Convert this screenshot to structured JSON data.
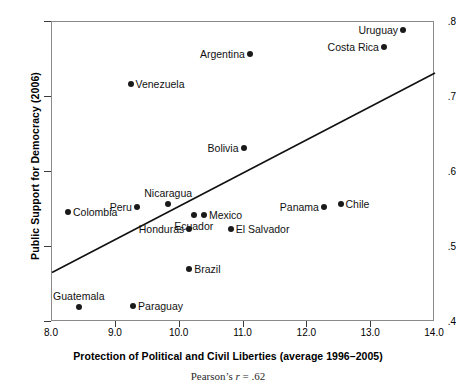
{
  "chart_data": {
    "type": "scatter",
    "title": "",
    "xlabel": "Protection of Political and Civil Liberties (average 1996–2005)",
    "ylabel": "Public Support for Democracy (2006)",
    "caption_prefix": "Pearson’s ",
    "caption_stat": "r",
    "caption_value": " = .62",
    "xlim": [
      8.0,
      14.0
    ],
    "ylim": [
      0.4,
      0.8
    ],
    "grid": false,
    "legend": "none",
    "xticks": [
      "8.0",
      "9.0",
      "10.0",
      "11.0",
      "12.0",
      "13.0",
      "14.0"
    ],
    "xtick_values": [
      8.0,
      9.0,
      10.0,
      11.0,
      12.0,
      13.0,
      14.0
    ],
    "yticks": [
      ".4",
      ".5",
      ".6",
      ".7",
      ".8"
    ],
    "ytick_values": [
      0.4,
      0.5,
      0.6,
      0.7,
      0.8
    ],
    "points": [
      {
        "label": "Uruguay",
        "x": 13.5,
        "y": 0.789,
        "pos": "left"
      },
      {
        "label": "Costa Rica",
        "x": 13.2,
        "y": 0.767,
        "pos": "left"
      },
      {
        "label": "Argentina",
        "x": 11.1,
        "y": 0.757,
        "pos": "left"
      },
      {
        "label": "Venezuela",
        "x": 9.23,
        "y": 0.717,
        "pos": "right"
      },
      {
        "label": "Bolivia",
        "x": 11.0,
        "y": 0.632,
        "pos": "left"
      },
      {
        "label": "Nicaragua",
        "x": 9.82,
        "y": 0.557,
        "pos": "above"
      },
      {
        "label": "Chile",
        "x": 12.52,
        "y": 0.557,
        "pos": "right"
      },
      {
        "label": "Peru",
        "x": 9.33,
        "y": 0.553,
        "pos": "left"
      },
      {
        "label": "Panama",
        "x": 12.26,
        "y": 0.553,
        "pos": "left"
      },
      {
        "label": "Colombia",
        "x": 8.25,
        "y": 0.547,
        "pos": "right"
      },
      {
        "label": "Mexico",
        "x": 10.38,
        "y": 0.543,
        "pos": "right"
      },
      {
        "label": "Ecuador",
        "x": 10.22,
        "y": 0.543,
        "pos": "below"
      },
      {
        "label": "Honduras",
        "x": 10.15,
        "y": 0.524,
        "pos": "left"
      },
      {
        "label": "El Salvador",
        "x": 10.8,
        "y": 0.524,
        "pos": "right"
      },
      {
        "label": "Brazil",
        "x": 10.15,
        "y": 0.471,
        "pos": "right"
      },
      {
        "label": "Paraguay",
        "x": 9.27,
        "y": 0.421,
        "pos": "right"
      },
      {
        "label": "Guatemala",
        "x": 8.42,
        "y": 0.42,
        "pos": "above"
      }
    ],
    "regression_line": {
      "x0": 8.0,
      "y0": 0.466,
      "x1": 14.0,
      "y1": 0.732,
      "color": "#111111"
    },
    "point_color": "#1a1a1a",
    "frame_color": "#8a8a8a"
  }
}
